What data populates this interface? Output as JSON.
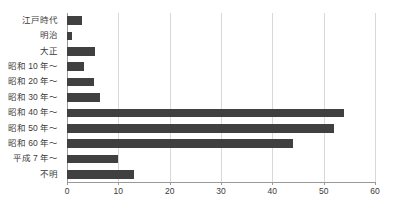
{
  "chart_data": {
    "type": "bar",
    "orientation": "horizontal",
    "title": "",
    "xlabel": "",
    "ylabel": "",
    "xlim": [
      0,
      60
    ],
    "xticks": [
      0,
      10,
      20,
      30,
      40,
      50,
      60
    ],
    "xtick_labels": [
      "0",
      "10",
      "20",
      "30",
      "40",
      "50",
      "60"
    ],
    "grid": true,
    "grid_axis": "x",
    "legend": false,
    "bar_color": "#404040",
    "categories": [
      "江戸時代",
      "明治",
      "大正",
      "昭和 10 年～",
      "昭和 20 年～",
      "昭和 30 年～",
      "昭和 40 年～",
      "昭和 50 年～",
      "昭和 60 年～",
      "平成 7 年～",
      "不明"
    ],
    "values": [
      3,
      1,
      5.5,
      3.3,
      5.3,
      6.5,
      54,
      52,
      44,
      10,
      13
    ]
  },
  "colors": {
    "background": "#ffffff",
    "bar": "#404040",
    "grid": "#d8d8d8",
    "axis": "#9a9a9a",
    "text": "#3a3a3a"
  }
}
